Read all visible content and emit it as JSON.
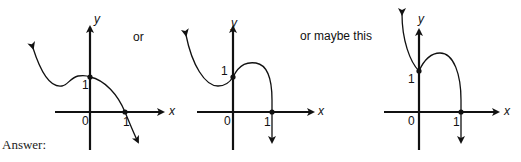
{
  "connectors": {
    "first": "or",
    "second": "or maybe this"
  },
  "answer_label": "Answer:",
  "graphs": [
    {
      "axis_x_label": "x",
      "axis_y_label": "y",
      "origin_label": "0",
      "y_intercept_label": "1",
      "x_intercept_label": "1",
      "description": "Curve from upper-left arrow, dips to local min left of y-axis, rises to (0,1), falls through (1,0) with arrow down-right"
    },
    {
      "axis_x_label": "x",
      "axis_y_label": "y",
      "origin_label": "0",
      "y_intercept_label": "1",
      "x_intercept_label": "1",
      "description": "Curve from upper-left arrow, local min left of y-axis, through (0,1), local max near x=0.5, drops vertically through (1,0) with arrow down"
    },
    {
      "axis_x_label": "x",
      "axis_y_label": "y",
      "origin_label": "0",
      "y_intercept_label": "1",
      "x_intercept_label": "1",
      "description": "Steep curve from top arrow down to cusp-like min at (0,1), rises to local max, drops through (1,0) with arrow down"
    }
  ]
}
